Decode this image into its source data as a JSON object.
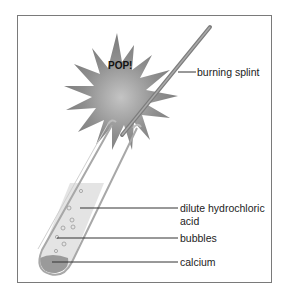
{
  "diagram": {
    "exclamation": "POP!",
    "labels": {
      "splint": "burning splint",
      "acid_line1": "dilute hydrochloric",
      "acid_line2": "acid",
      "bubbles": "bubbles",
      "calcium": "calcium"
    },
    "colors": {
      "explosion": "#8c8c8c",
      "explosion_center": "#b5b5b5",
      "splint": "#8a8a8a",
      "acid": "#e6e6e6",
      "calcium": "#9a9a9a",
      "frame": "#7a7a7a",
      "leader": "#333333"
    }
  }
}
